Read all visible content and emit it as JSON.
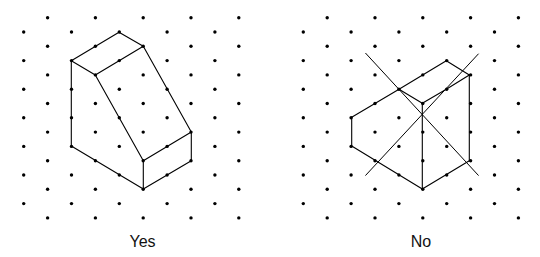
{
  "colors": {
    "dot": "#000000",
    "line": "#000000",
    "background": "#ffffff"
  },
  "grid": {
    "columns": 10,
    "rows": 15,
    "col_spacing": 23.9,
    "row_spacing": 14.3,
    "row0_y": 17.7,
    "dot_radius": 1.7,
    "pattern": "even rows use odd columns, odd rows use even columns (isometric)"
  },
  "panels": [
    {
      "id": "yes",
      "caption": "Yes",
      "caption_x": 142.5,
      "origin_x": 23.7,
      "figure": "isometric drawing of a block with a sloped face (correct)",
      "segments": [
        [
          [
            71.3,
            60.7
          ],
          [
            119.0,
            32.3
          ]
        ],
        [
          [
            119.0,
            32.3
          ],
          [
            143.3,
            46.3
          ]
        ],
        [
          [
            143.3,
            46.3
          ],
          [
            95.3,
            75.0
          ]
        ],
        [
          [
            95.3,
            75.0
          ],
          [
            71.3,
            60.7
          ]
        ],
        [
          [
            71.3,
            60.7
          ],
          [
            71.3,
            146.0
          ]
        ],
        [
          [
            71.3,
            146.0
          ],
          [
            143.3,
            189.0
          ]
        ],
        [
          [
            95.3,
            75.0
          ],
          [
            143.3,
            160.7
          ]
        ],
        [
          [
            143.3,
            46.3
          ],
          [
            191.3,
            132.0
          ]
        ],
        [
          [
            191.3,
            132.0
          ],
          [
            143.3,
            160.7
          ]
        ],
        [
          [
            143.3,
            160.7
          ],
          [
            143.3,
            189.0
          ]
        ],
        [
          [
            191.3,
            132.0
          ],
          [
            191.3,
            160.7
          ]
        ],
        [
          [
            191.3,
            160.7
          ],
          [
            143.3,
            189.0
          ]
        ]
      ]
    },
    {
      "id": "no",
      "caption": "No",
      "caption_x": 421,
      "origin_x": 303.3,
      "figure": "incorrect isometric drawing crossed out with an X",
      "segments": [
        [
          [
            351.7,
            117.3
          ],
          [
            351.7,
            146.0
          ]
        ],
        [
          [
            351.7,
            117.3
          ],
          [
            399.0,
            89.3
          ]
        ],
        [
          [
            399.0,
            89.3
          ],
          [
            446.3,
            60.7
          ]
        ],
        [
          [
            446.3,
            60.7
          ],
          [
            469.3,
            75.0
          ]
        ],
        [
          [
            469.3,
            75.0
          ],
          [
            469.3,
            160.7
          ]
        ],
        [
          [
            469.3,
            160.7
          ],
          [
            422.3,
            189.0
          ]
        ],
        [
          [
            422.3,
            189.0
          ],
          [
            351.7,
            146.0
          ]
        ],
        [
          [
            399.0,
            89.3
          ],
          [
            422.3,
            103.3
          ]
        ],
        [
          [
            422.3,
            103.3
          ],
          [
            446.3,
            89.3
          ]
        ],
        [
          [
            446.3,
            89.3
          ],
          [
            469.3,
            75.0
          ]
        ],
        [
          [
            422.3,
            103.3
          ],
          [
            422.3,
            189.0
          ]
        ]
      ],
      "cross_out": [
        [
          [
            365.7,
            53.3
          ],
          [
            478.3,
            175.3
          ]
        ],
        [
          [
            478.3,
            54.0
          ],
          [
            365.7,
            175.3
          ]
        ]
      ]
    }
  ]
}
